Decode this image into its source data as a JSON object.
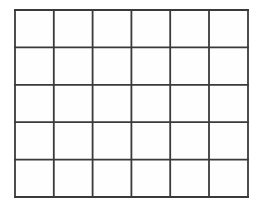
{
  "figure": {
    "kind": "grid-diagram",
    "title": "",
    "caption": "",
    "background_color": "#ffffff",
    "line_color": "#3a3a3a",
    "cell_fill_color": "#fefefe",
    "line_width_px": 1.8,
    "columns": 6,
    "rows": 5,
    "cells_total": 30,
    "bounds": {
      "left": 15,
      "top": 10,
      "right": 248,
      "bottom": 197,
      "width": 233,
      "height": 187
    },
    "cell_size": {
      "width": 38.8,
      "height": 37.4
    },
    "vertical_line_x": [
      15,
      53.8,
      92.6,
      131.4,
      170.2,
      209,
      248
    ],
    "horizontal_line_y": [
      10,
      47.4,
      84.8,
      122.2,
      159.6,
      197
    ],
    "cell_labels": [
      [
        "",
        "",
        "",
        "",
        "",
        ""
      ],
      [
        "",
        "",
        "",
        "",
        "",
        ""
      ],
      [
        "",
        "",
        "",
        "",
        "",
        ""
      ],
      [
        "",
        "",
        "",
        "",
        "",
        ""
      ],
      [
        "",
        "",
        "",
        "",
        "",
        ""
      ]
    ]
  }
}
